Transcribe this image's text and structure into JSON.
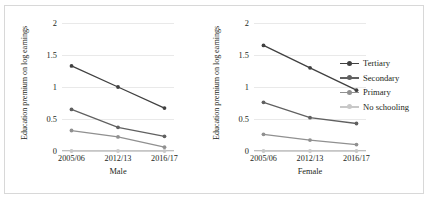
{
  "figure": {
    "background": "#ffffff",
    "border_color": "#d8d8d8"
  },
  "axis": {
    "y_title": "Education premium on log earnings",
    "y_ticks": [
      "2",
      "1.5",
      "1",
      "0.5",
      "0"
    ],
    "y_tick_values": [
      2,
      1.5,
      1,
      0.5,
      0
    ],
    "x_ticks": [
      "2005/06",
      "2012/13",
      "2016/17"
    ]
  },
  "panels": [
    {
      "id": "male",
      "x_title": "Male"
    },
    {
      "id": "female",
      "x_title": "Female"
    }
  ],
  "legend": {
    "position": "right",
    "items": [
      {
        "label": "Tertiary",
        "color": "#404040"
      },
      {
        "label": "Secondary",
        "color": "#606060"
      },
      {
        "label": "Primary",
        "color": "#909090"
      },
      {
        "label": "No schooling",
        "color": "#c8c8c8"
      }
    ]
  },
  "chart_data": [
    {
      "type": "line",
      "title": "Male",
      "xlabel": "Male",
      "ylabel": "Education premium on log earnings",
      "categories": [
        "2005/06",
        "2012/13",
        "2016/17"
      ],
      "ylim": [
        0,
        2
      ],
      "yticks": [
        0,
        0.5,
        1,
        1.5,
        2
      ],
      "grid": true,
      "legend_position": "right",
      "series": [
        {
          "name": "Tertiary",
          "values": [
            1.33,
            1.0,
            0.67
          ],
          "color": "#404040"
        },
        {
          "name": "Secondary",
          "values": [
            0.65,
            0.37,
            0.23
          ],
          "color": "#606060"
        },
        {
          "name": "Primary",
          "values": [
            0.32,
            0.22,
            0.06
          ],
          "color": "#909090"
        },
        {
          "name": "No schooling",
          "values": [
            0.0,
            0.0,
            0.0
          ],
          "color": "#c8c8c8"
        }
      ]
    },
    {
      "type": "line",
      "title": "Female",
      "xlabel": "Female",
      "ylabel": "Education premium on log earnings",
      "categories": [
        "2005/06",
        "2012/13",
        "2016/17"
      ],
      "ylim": [
        0,
        2
      ],
      "yticks": [
        0,
        0.5,
        1,
        1.5,
        2
      ],
      "grid": true,
      "legend_position": "right",
      "series": [
        {
          "name": "Tertiary",
          "values": [
            1.65,
            1.3,
            0.95
          ],
          "color": "#404040"
        },
        {
          "name": "Secondary",
          "values": [
            0.76,
            0.52,
            0.43
          ],
          "color": "#606060"
        },
        {
          "name": "Primary",
          "values": [
            0.26,
            0.17,
            0.1
          ],
          "color": "#909090"
        },
        {
          "name": "No schooling",
          "values": [
            0.0,
            0.0,
            0.0
          ],
          "color": "#c8c8c8"
        }
      ]
    }
  ]
}
